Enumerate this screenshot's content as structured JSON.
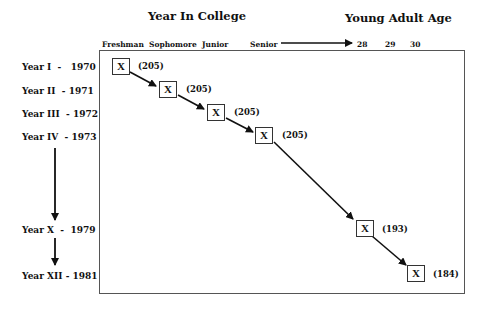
{
  "headers": {
    "college": "Year In College",
    "adult": "Young Adult Age"
  },
  "columns": [
    "Freshman",
    "Sophomore",
    "Junior",
    "Senior",
    "28",
    "29",
    "30"
  ],
  "rows": [
    {
      "year": "Year I",
      "date": "1970"
    },
    {
      "year": "Year II",
      "date": "1971"
    },
    {
      "year": "Year III",
      "date": "1972"
    },
    {
      "year": "Year IV",
      "date": "1973"
    },
    {
      "year": "Year X",
      "date": "1979"
    },
    {
      "year": "Year XII",
      "date": "1981"
    }
  ],
  "row_sep": "-",
  "nodes": [
    {
      "mark": "X",
      "count": "(205)"
    },
    {
      "mark": "X",
      "count": "(205)"
    },
    {
      "mark": "X",
      "count": "(205)"
    },
    {
      "mark": "X",
      "count": "(205)"
    },
    {
      "mark": "X",
      "count": "(193)"
    },
    {
      "mark": "X",
      "count": "(184)"
    }
  ]
}
